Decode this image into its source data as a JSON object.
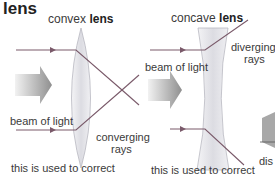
{
  "title": "lens",
  "convex": {
    "heading_prefix": "convex",
    "heading_bold": "lens",
    "beam_label": "beam of light",
    "rays_label_1": "converging",
    "rays_label_2": "rays",
    "caption": "this is used to correct"
  },
  "concave": {
    "heading_prefix": "concave",
    "heading_bold": "lens",
    "beam_label": "beam of light",
    "rays_label_1": "diverging",
    "rays_label_2": "rays",
    "caption": "this is used to correct"
  },
  "cropped_right_label": "dis",
  "colors": {
    "ray": "#7a5a6a",
    "lens_fill": "#e6e6ea",
    "lens_edge": "#b8b8c0",
    "arrow": "#a0a0a0"
  }
}
